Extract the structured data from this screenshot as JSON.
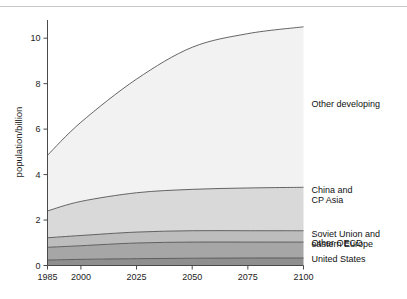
{
  "chart_data": {
    "type": "area",
    "stacked": true,
    "title": "",
    "xlabel": "",
    "ylabel": "population/billion",
    "x": [
      1985,
      2000,
      2025,
      2050,
      2075,
      2100
    ],
    "xlim": [
      1985,
      2100
    ],
    "ylim": [
      0,
      10.8
    ],
    "xticks": [
      "1985",
      "2000",
      "2025",
      "2050",
      "2075",
      "2100"
    ],
    "yticks": [
      "0",
      "2",
      "4",
      "6",
      "8",
      "10"
    ],
    "grid": false,
    "legend_position": "right-inline",
    "series": [
      {
        "name": "United States",
        "color": "#8f8f8f",
        "values": [
          0.24,
          0.27,
          0.3,
          0.32,
          0.33,
          0.33
        ]
      },
      {
        "name": "Other OECD",
        "color": "#a6a6a6",
        "values": [
          0.56,
          0.6,
          0.69,
          0.71,
          0.7,
          0.7
        ]
      },
      {
        "name": "Soviet Union and eastern Europe",
        "color": "#bdbdbd",
        "values": [
          0.42,
          0.45,
          0.48,
          0.5,
          0.5,
          0.5
        ]
      },
      {
        "name": "China and CP Asia",
        "color": "#d9d9d9",
        "values": [
          1.18,
          1.5,
          1.73,
          1.82,
          1.88,
          1.91
        ]
      },
      {
        "name": "Other developing",
        "color": "#f2f2f2",
        "values": [
          2.45,
          3.48,
          5.0,
          6.25,
          6.79,
          7.06
        ]
      }
    ],
    "cumulative_tops": {
      "United States": [
        0.24,
        0.27,
        0.3,
        0.32,
        0.33,
        0.33
      ],
      "Other OECD": [
        0.8,
        0.87,
        0.99,
        1.03,
        1.03,
        1.03
      ],
      "Soviet Union and eastern Europe": [
        1.22,
        1.32,
        1.47,
        1.53,
        1.53,
        1.53
      ],
      "China and CP Asia": [
        2.4,
        2.82,
        3.2,
        3.35,
        3.41,
        3.44
      ],
      "Other developing": [
        4.85,
        6.3,
        8.2,
        9.6,
        10.2,
        10.5
      ]
    }
  },
  "axis": {
    "y_title": "population/billion",
    "y_ticks": [
      "10",
      "8",
      "6",
      "4",
      "2",
      "0"
    ],
    "x_ticks": [
      "1985",
      "2000",
      "2025",
      "2050",
      "2075",
      "2100"
    ]
  },
  "legend": {
    "items": [
      {
        "label_line1": "Other developing",
        "label_line2": ""
      },
      {
        "label_line1": "China and",
        "label_line2": "CP Asia"
      },
      {
        "label_line1": "Soviet Union and",
        "label_line2": "eastern Europe"
      },
      {
        "label_line1": "Other OECD",
        "label_line2": ""
      },
      {
        "label_line1": "United States",
        "label_line2": ""
      }
    ]
  }
}
